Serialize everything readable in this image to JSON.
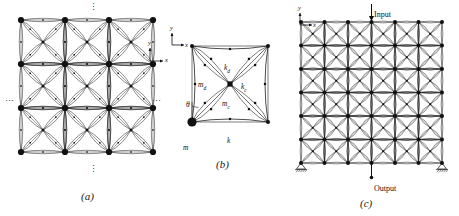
{
  "figure": {
    "type": "scientific-diagram",
    "background": "#ffffff",
    "ink_color": "#111111",
    "panel_count": 3
  },
  "panel_a": {
    "caption": "(a)",
    "description": "infinite periodic lattice, 3 by 3 unit cells shown",
    "cells_x": 3,
    "cells_y": 3,
    "nodes_x": 4,
    "nodes_y": 4,
    "ellipsis_top": "⋮",
    "ellipsis_bottom": "⋮",
    "ellipsis_left": "⋯",
    "ellipsis_right": "⋯",
    "axes": {
      "x_label": "x",
      "y_label": "y"
    }
  },
  "panel_b": {
    "caption": "(b)",
    "description": "single unit cell detail with lumped masses and springs",
    "labels": {
      "corner_mass": "m",
      "diagonal_mass": "m",
      "diagonal_mass_sub": "d",
      "center_mass": "m",
      "center_mass_sub": "c",
      "edge_spring": "k",
      "diagonal_spring": "k",
      "diagonal_spring_sub": "d",
      "center_spring": "k",
      "center_spring_sub": "c",
      "angle": "θ"
    },
    "axes": {
      "x_label": "x",
      "y_label": "y"
    }
  },
  "panel_c": {
    "caption": "(c)",
    "description": "finite lattice, 6 by 6 unit cells, with input excitation and output measurement",
    "cells_x": 6,
    "cells_y": 6,
    "nodes_x": 7,
    "nodes_y": 7,
    "input_label": "Input",
    "output_label": "Output",
    "support_left": "fixed-pin-support",
    "support_right": "fixed-pin-support",
    "axes": {
      "x_label": "x",
      "y_label": "y"
    }
  }
}
